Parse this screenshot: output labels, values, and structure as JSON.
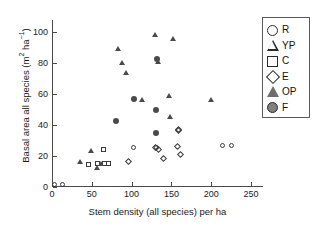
{
  "chart_data": {
    "type": "scatter",
    "title": "",
    "xlabel": "Stem density (all species) per ha",
    "ylabel_text": "Basal area all species (m",
    "ylabel_sup1": "2",
    "ylabel_mid": " ha",
    "ylabel_sup2": "−1",
    "ylabel_end": ")",
    "ylabel_plain": "Basal area all species (m2 ha-1)",
    "xlim": [
      0,
      265
    ],
    "ylim": [
      0,
      108
    ],
    "xticks": [
      0,
      50,
      100,
      150,
      200,
      250
    ],
    "yticks": [
      0,
      20,
      40,
      60,
      80,
      100
    ],
    "grid": false,
    "legend_position": "right-outside",
    "marker_color": "#4a4a4a",
    "axis_color": "#4a4a4a",
    "series": [
      {
        "name": "R",
        "label": "R",
        "marker": "circle-open",
        "points": [
          [
            4,
            1
          ],
          [
            15,
            1
          ],
          [
            103,
            25
          ],
          [
            133,
            25
          ],
          [
            216,
            26
          ],
          [
            227,
            26
          ]
        ]
      },
      {
        "name": "YP",
        "label": "YP",
        "marker": "triangle-open",
        "points": [
          [
            38,
            16
          ],
          [
            44,
            17
          ]
        ]
      },
      {
        "name": "C",
        "label": "C",
        "marker": "square-open",
        "points": [
          [
            47,
            14
          ],
          [
            58,
            15
          ],
          [
            65,
            24
          ],
          [
            67,
            15
          ],
          [
            72,
            15
          ]
        ]
      },
      {
        "name": "E",
        "label": "E",
        "marker": "diamond-open",
        "points": [
          [
            97,
            16
          ],
          [
            131,
            25
          ],
          [
            135,
            24
          ],
          [
            141,
            18
          ],
          [
            158,
            26
          ],
          [
            159,
            37
          ],
          [
            160,
            36
          ],
          [
            162,
            21
          ]
        ]
      },
      {
        "name": "OP",
        "label": "OP",
        "marker": "triangle-filled",
        "points": [
          [
            36,
            16
          ],
          [
            50,
            23
          ],
          [
            57,
            12
          ],
          [
            62,
            15
          ],
          [
            84,
            89
          ],
          [
            88,
            80
          ],
          [
            93,
            74
          ],
          [
            113,
            56
          ],
          [
            130,
            98
          ],
          [
            134,
            81
          ],
          [
            148,
            59
          ],
          [
            149,
            45
          ],
          [
            152,
            96
          ],
          [
            200,
            56
          ]
        ]
      },
      {
        "name": "F",
        "label": "F",
        "marker": "circle-filled",
        "points": [
          [
            81,
            43
          ],
          [
            103,
            57
          ],
          [
            130,
            50
          ],
          [
            131,
            35
          ],
          [
            132,
            83
          ]
        ]
      }
    ]
  },
  "legend": {
    "items": [
      {
        "label": "R",
        "marker": "circle-open"
      },
      {
        "label": "YP",
        "marker": "triangle-open"
      },
      {
        "label": "C",
        "marker": "square-open"
      },
      {
        "label": "E",
        "marker": "diamond-open"
      },
      {
        "label": "OP",
        "marker": "triangle-filled"
      },
      {
        "label": "F",
        "marker": "circle-filled"
      }
    ]
  }
}
